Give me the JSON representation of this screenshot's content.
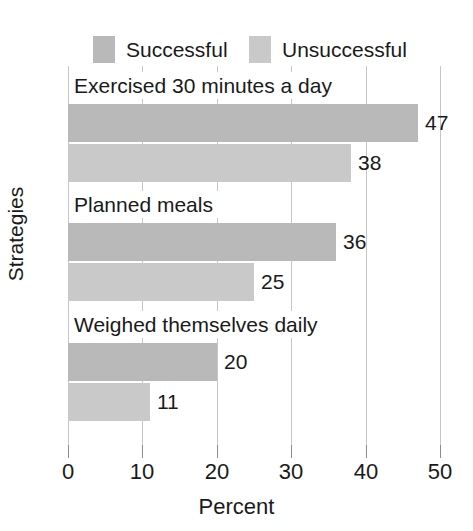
{
  "chart_data": {
    "type": "bar",
    "orientation": "horizontal",
    "title": "",
    "xlabel": "Percent",
    "ylabel": "Strategies",
    "xlim": [
      0,
      50
    ],
    "xticks": [
      0,
      10,
      20,
      30,
      40,
      50
    ],
    "xtick_labels": [
      "0",
      "10",
      "20",
      "30",
      "40",
      "50"
    ],
    "grid": true,
    "grid_axis": "x",
    "legend_position": "top",
    "categories": [
      "Exercised 30 minutes a day",
      "Planned meals",
      "Weighed themselves daily"
    ],
    "series": [
      {
        "name": "Successful",
        "color": "#b9b9b9",
        "values": [
          47,
          38,
          20
        ],
        "value_labels": [
          "47",
          "38",
          "20"
        ]
      },
      {
        "name": "Unsuccessful",
        "color": "#c9c9c9",
        "values": [
          38,
          25,
          11
        ],
        "value_labels": [
          "38",
          "25",
          "11"
        ]
      }
    ],
    "bars": [
      {
        "category": "Exercised 30 minutes a day",
        "series": "Successful",
        "value": 47,
        "label": "47"
      },
      {
        "category": "Exercised 30 minutes a day",
        "series": "Unsuccessful",
        "value": 38,
        "label": "38"
      },
      {
        "category": "Planned meals",
        "series": "Successful",
        "value": 36,
        "label": "36"
      },
      {
        "category": "Planned meals",
        "series": "Unsuccessful",
        "value": 25,
        "label": "25"
      },
      {
        "category": "Weighed themselves daily",
        "series": "Successful",
        "value": 20,
        "label": "20"
      },
      {
        "category": "Weighed themselves daily",
        "series": "Unsuccessful",
        "value": 11,
        "label": "11"
      }
    ]
  },
  "legend": {
    "items": [
      {
        "label": "Successful",
        "color": "#b9b9b9"
      },
      {
        "label": "Unsuccessful",
        "color": "#c9c9c9"
      }
    ]
  },
  "axes": {
    "x": {
      "title": "Percent",
      "ticks": [
        "0",
        "10",
        "20",
        "30",
        "40",
        "50"
      ]
    },
    "y": {
      "title": "Strategies",
      "categories": [
        "Exercised 30 minutes a day",
        "Planned meals",
        "Weighed themselves daily"
      ]
    }
  },
  "colors": {
    "successful": "#b9b9b9",
    "unsuccessful": "#c9c9c9",
    "grid": "#c6c6c6",
    "axis": "#8c8c8c",
    "text": "#1a1a1a",
    "background": "#ffffff"
  }
}
